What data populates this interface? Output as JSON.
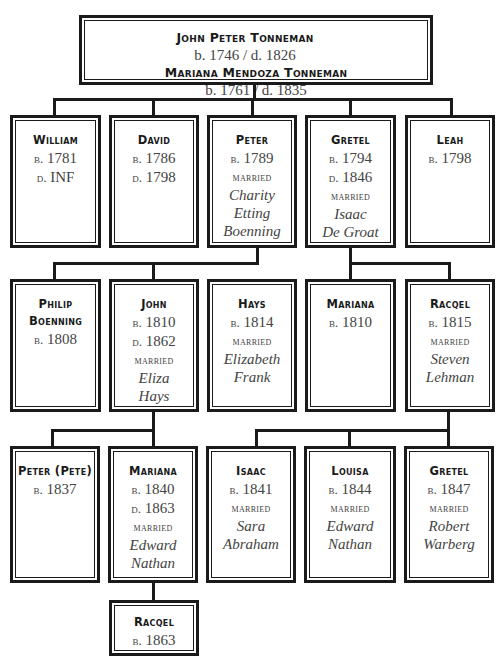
{
  "root": {
    "persons": [
      {
        "name": "John Peter Tonneman",
        "dates": "b. 1746 / d. 1826"
      },
      {
        "name": "Mariana Mendoza Tonneman",
        "dates": "b. 1761 / d. 1835"
      }
    ]
  },
  "generation1": [
    {
      "name": "William",
      "born": "1781",
      "died": "INF"
    },
    {
      "name": "David",
      "born": "1786",
      "died": "1798"
    },
    {
      "name": "Peter",
      "born": "1789",
      "married_label": "married",
      "spouse": [
        "Charity",
        "Etting",
        "Boenning"
      ]
    },
    {
      "name": "Gretel",
      "born": "1794",
      "died": "1846",
      "married_label": "married",
      "spouse": [
        "Isaac",
        "De Groat"
      ]
    },
    {
      "name": "Leah",
      "born": "1798"
    }
  ],
  "generation2": [
    {
      "name": "Philip",
      "name2": "Boenning",
      "born": "1808",
      "parent": "Peter"
    },
    {
      "name": "John",
      "born": "1810",
      "died": "1862",
      "married_label": "married",
      "spouse": [
        "Eliza",
        "Hays"
      ],
      "parent": "Peter"
    },
    {
      "name": "Hays",
      "born": "1814",
      "married_label": "married",
      "spouse": [
        "Elizabeth",
        "Frank"
      ],
      "parent": "Peter"
    },
    {
      "name": "Mariana",
      "born": "1810",
      "parent": "Gretel"
    },
    {
      "name": "Racqel",
      "born": "1815",
      "married_label": "married",
      "spouse": [
        "Steven",
        "Lehman"
      ],
      "parent": "Gretel"
    }
  ],
  "generation3": [
    {
      "name": "Peter (Pete)",
      "born": "1837",
      "parent": "John"
    },
    {
      "name": "Mariana",
      "born": "1840",
      "died": "1863",
      "married_label": "married",
      "spouse": [
        "Edward",
        "Nathan"
      ],
      "parent": "John"
    },
    {
      "name": "Isaac",
      "born": "1841",
      "married_label": "married",
      "spouse": [
        "Sara",
        "Abraham"
      ],
      "parent": "Racqel"
    },
    {
      "name": "Louisa",
      "born": "1844",
      "married_label": "married",
      "spouse": [
        "Edward",
        "Nathan"
      ],
      "parent": "Racqel"
    },
    {
      "name": "Gretel",
      "born": "1847",
      "married_label": "married",
      "spouse": [
        "Robert",
        "Warberg"
      ],
      "parent": "Racqel"
    }
  ],
  "generation4": [
    {
      "name": "Racqel",
      "born": "1863",
      "parent": "Mariana"
    }
  ],
  "labels": {
    "born_prefix": "b.",
    "died_prefix": "d."
  }
}
